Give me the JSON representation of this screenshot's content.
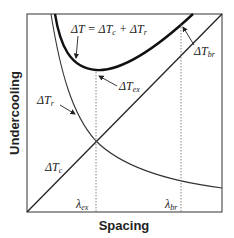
{
  "diagram": {
    "type": "undercooling-vs-spacing",
    "x_axis_label": "Spacing",
    "y_axis_label": "Undercooling",
    "curves": [
      {
        "name": "total",
        "label_main": "ΔT = ΔT",
        "label_sub1": "c",
        "label_mid": " + ΔT",
        "label_sub2": "r",
        "style": "thick"
      },
      {
        "name": "curvature",
        "label_main": "ΔT",
        "label_sub": "r",
        "style": "thin"
      },
      {
        "name": "constitutional",
        "label_main": "ΔT",
        "label_sub": "c",
        "style": "thin-straight"
      }
    ],
    "markers": [
      {
        "name": "extremum",
        "label_main": "ΔT",
        "label_sub": "ex",
        "lambda_main": "λ",
        "lambda_sub": "ex"
      },
      {
        "name": "branching",
        "label_main": "ΔT",
        "label_sub": "br",
        "lambda_main": "λ",
        "lambda_sub": "br"
      }
    ],
    "colors": {
      "line": "#222222",
      "dotted": "#555555",
      "background": "#ffffff"
    }
  }
}
